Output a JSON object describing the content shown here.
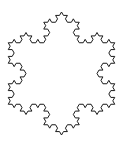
{
  "figure": {
    "type": "koch-snowflake",
    "iterations": 3,
    "center": [
      61.5,
      73.5
    ],
    "tip_radius": 61.5,
    "orientation": "vertex-up",
    "stroke_color": "#1a1a1a",
    "background_color": "#ffffff",
    "fill": "none"
  }
}
